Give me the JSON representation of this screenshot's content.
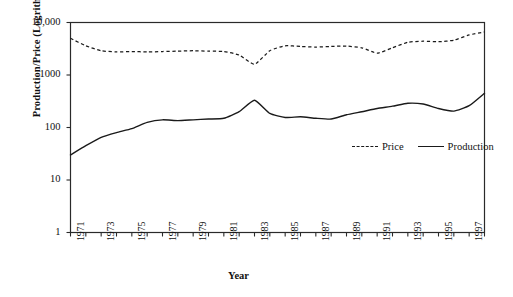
{
  "chart_data": {
    "type": "line",
    "title": "",
    "xlabel": "Year",
    "ylabel": "Production/Price (Logrithmic)",
    "yscale": "log",
    "ylim": [
      1,
      10000
    ],
    "xlim": [
      1971,
      1998
    ],
    "grid": false,
    "legend_position": "inside-bottom-right",
    "ytick_labels": [
      "10,000",
      "1000",
      "100",
      "10",
      "1"
    ],
    "ytick_values": [
      10000,
      1000,
      100,
      10,
      1
    ],
    "xtick_labels": [
      "1971",
      "1973",
      "1975",
      "1977",
      "1979",
      "1981",
      "1983",
      "1985",
      "1987",
      "1989",
      "1991",
      "1993",
      "1995",
      "1997"
    ],
    "xtick_values": [
      1971,
      1973,
      1975,
      1977,
      1979,
      1981,
      1983,
      1985,
      1987,
      1989,
      1991,
      1993,
      1995,
      1997
    ],
    "x": [
      1971,
      1972,
      1973,
      1974,
      1975,
      1976,
      1977,
      1978,
      1979,
      1980,
      1981,
      1982,
      1983,
      1984,
      1985,
      1986,
      1987,
      1988,
      1989,
      1990,
      1991,
      1992,
      1993,
      1994,
      1995,
      1996,
      1997,
      1998
    ],
    "series": [
      {
        "name": "Price",
        "style": "dashed",
        "color": "#1a1a1a",
        "values": [
          5000,
          3600,
          2900,
          2750,
          2800,
          2750,
          2800,
          2850,
          2900,
          2850,
          2800,
          2400,
          1600,
          2900,
          3600,
          3500,
          3400,
          3500,
          3550,
          3300,
          2600,
          3300,
          4200,
          4400,
          4300,
          4600,
          5800,
          6600
        ]
      },
      {
        "name": "Production",
        "style": "solid",
        "color": "#1a1a1a",
        "values": [
          30,
          45,
          65,
          80,
          95,
          125,
          140,
          135,
          140,
          145,
          150,
          200,
          330,
          185,
          155,
          160,
          150,
          145,
          175,
          200,
          230,
          255,
          290,
          280,
          230,
          205,
          260,
          450
        ]
      }
    ]
  },
  "legend": {
    "price_label": "Price",
    "production_label": "Production"
  },
  "axes": {
    "y_title": "Production/Price (Logrithmic)",
    "x_title": "Year"
  }
}
